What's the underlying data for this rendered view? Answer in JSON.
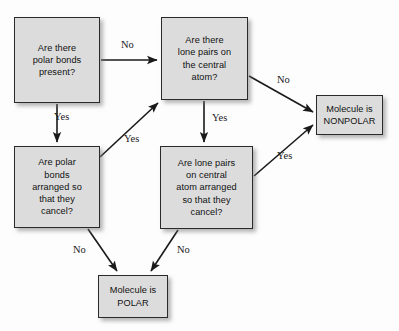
{
  "diagram": {
    "canvas": {
      "width": 399,
      "height": 331,
      "background": "#fdfdfd"
    },
    "style": {
      "node_fill": "#dcdcdc",
      "node_border": "#2a2a2a",
      "edge_color": "#1a1a1a",
      "text_color": "#111111"
    },
    "nodes": [
      {
        "id": "polar-bonds-present",
        "text": "Are there\npolar bonds\npresent?",
        "kind": "decision",
        "x": 14,
        "y": 17,
        "w": 86,
        "h": 86
      },
      {
        "id": "lone-pairs-central-atom",
        "text": "Are there\nlone pairs on\nthe central\natom?",
        "kind": "decision",
        "x": 161,
        "y": 17,
        "w": 87,
        "h": 83
      },
      {
        "id": "molecule-nonpolar",
        "text": "Molecule is\nNONPOLAR",
        "kind": "terminal",
        "x": 316,
        "y": 95,
        "w": 67,
        "h": 40
      },
      {
        "id": "polar-bonds-cancel",
        "text": "Are polar\nbonds\narranged so\nthat they\ncancel?",
        "kind": "decision",
        "x": 14,
        "y": 146,
        "w": 86,
        "h": 82
      },
      {
        "id": "lone-pairs-cancel",
        "text": "Are lone pairs\non central\natom arranged\nso that they\ncancel?",
        "kind": "decision",
        "x": 160,
        "y": 146,
        "w": 93,
        "h": 83
      },
      {
        "id": "molecule-polar",
        "text": "Molecule is\nPOLAR",
        "kind": "terminal",
        "x": 98,
        "y": 275,
        "w": 70,
        "h": 43
      }
    ],
    "edges": [
      {
        "id": "edge-polar-bonds-no",
        "from": "polar-bonds-present",
        "to": "lone-pairs-central-atom",
        "label": "No",
        "label_x": 121,
        "label_y": 39,
        "path": "M 101 60 L 157 60"
      },
      {
        "id": "edge-polar-bonds-yes",
        "from": "polar-bonds-present",
        "to": "polar-bonds-cancel",
        "label": "Yes",
        "label_x": 54,
        "label_y": 111,
        "path": "M 57 104 L 57 142"
      },
      {
        "id": "edge-bonds-cancel-yes",
        "from": "polar-bonds-cancel",
        "to": "lone-pairs-central-atom",
        "label": "Yes",
        "label_x": 124,
        "label_y": 133,
        "path": "M 100 157 L 158 103"
      },
      {
        "id": "edge-lone-pairs-no",
        "from": "lone-pairs-central-atom",
        "to": "molecule-nonpolar",
        "label": "No",
        "label_x": 277,
        "label_y": 74,
        "path": "M 249 76 L 313 112"
      },
      {
        "id": "edge-lone-pairs-yes",
        "from": "lone-pairs-central-atom",
        "to": "lone-pairs-cancel",
        "label": "Yes",
        "label_x": 212,
        "label_y": 112,
        "path": "M 204 101 L 204 142"
      },
      {
        "id": "edge-lone-cancel-yes",
        "from": "lone-pairs-cancel",
        "to": "molecule-nonpolar",
        "label": "Yes",
        "label_x": 277,
        "label_y": 150,
        "path": "M 254 176 L 313 125"
      },
      {
        "id": "edge-bonds-cancel-no",
        "from": "polar-bonds-cancel",
        "to": "molecule-polar",
        "label": "No",
        "label_x": 73,
        "label_y": 244,
        "path": "M 88 229 L 117 271"
      },
      {
        "id": "edge-lone-cancel-no",
        "from": "lone-pairs-cancel",
        "to": "molecule-polar",
        "label": "No",
        "label_x": 177,
        "label_y": 244,
        "path": "M 178 230 L 151 271"
      }
    ]
  }
}
